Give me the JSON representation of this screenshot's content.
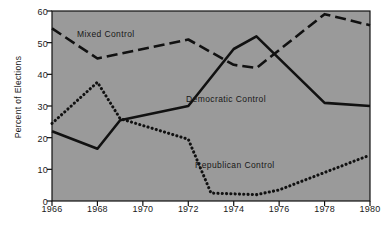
{
  "chart_data": {
    "type": "line",
    "title": "",
    "xlabel": "",
    "ylabel": "Percent of Elections",
    "ylim": [
      0,
      60
    ],
    "xlim": [
      1966,
      1980
    ],
    "yticks": [
      0,
      10,
      20,
      30,
      40,
      50,
      60
    ],
    "ytick_labels": [
      "0",
      "10",
      "20",
      "30",
      "40",
      "50",
      "60"
    ],
    "xticks": [
      1966,
      1968,
      1970,
      1972,
      1974,
      1976,
      1978,
      1980
    ],
    "xtick_labels": [
      "1966",
      "1968",
      "1970",
      "1972",
      "1974",
      "1976",
      "1978",
      "1980"
    ],
    "grid": false,
    "legend_position": "inline-annotations",
    "plot_background": "#9a9a9a",
    "line_color": "#111111",
    "series": [
      {
        "name": "Mixed Control",
        "style": "dashed",
        "x": [
          1966,
          1968,
          1972,
          1974,
          1975,
          1978,
          1980
        ],
        "values": [
          54.5,
          45.0,
          51.0,
          43.0,
          42.0,
          59.0,
          55.5
        ]
      },
      {
        "name": "Democratic Control",
        "style": "solid",
        "x": [
          1966,
          1968,
          1969,
          1972,
          1974,
          1975,
          1978,
          1980
        ],
        "values": [
          22.0,
          16.5,
          25.5,
          30.0,
          48.0,
          52.0,
          31.0,
          30.0
        ]
      },
      {
        "name": "Republican Control",
        "style": "dotted",
        "x": [
          1966,
          1968,
          1969,
          1972,
          1973,
          1975,
          1976,
          1980
        ],
        "values": [
          24.5,
          37.5,
          26.0,
          19.5,
          2.5,
          2.0,
          3.5,
          14.5
        ]
      }
    ],
    "annotations": [
      {
        "text": "Mixed Control",
        "x": 1967.1,
        "y": 52.5
      },
      {
        "text": "Democratic Control",
        "x": 1971.9,
        "y": 31.8
      },
      {
        "text": "Republican Control",
        "x": 1972.3,
        "y": 11.0
      }
    ]
  }
}
